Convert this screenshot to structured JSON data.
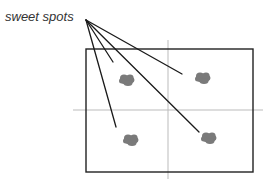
{
  "diagram": {
    "label": "sweet spots",
    "colors": {
      "frame": "#222222",
      "leader": "#1a1a1a",
      "crosshair": "#bbbbbb",
      "spot": "#7a7a7a",
      "label": "#333333"
    },
    "frame": {
      "x": 86,
      "y": 49,
      "width": 167,
      "height": 123
    },
    "crosshair": {
      "vertical": {
        "x": 168,
        "y1": 40,
        "y2": 179
      },
      "horizontal": {
        "y": 110,
        "x1": 73,
        "x2": 263
      }
    },
    "leader_origin": {
      "x": 86,
      "y": 20
    },
    "spots": [
      {
        "name": "top-left",
        "cx": 127,
        "cy": 80,
        "leader_end": {
          "x": 113,
          "y": 62
        }
      },
      {
        "name": "top-right",
        "cx": 203,
        "cy": 78,
        "leader_end": {
          "x": 182,
          "y": 74
        }
      },
      {
        "name": "bottom-left",
        "cx": 131,
        "cy": 140,
        "leader_end": {
          "x": 116,
          "y": 127
        }
      },
      {
        "name": "bottom-right",
        "cx": 209,
        "cy": 138,
        "leader_end": {
          "x": 199,
          "y": 132
        }
      }
    ]
  }
}
